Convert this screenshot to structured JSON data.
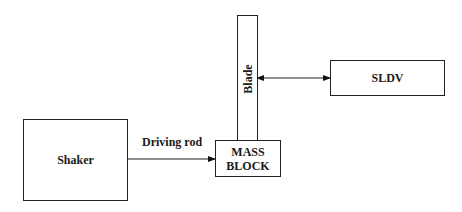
{
  "diagram": {
    "nodes": [
      {
        "id": "shaker",
        "label": "Shaker"
      },
      {
        "id": "mass_block",
        "label_line1": "MASS",
        "label_line2": "BLOCK"
      },
      {
        "id": "blade",
        "label": "Blade"
      },
      {
        "id": "sldv",
        "label": "SLDV"
      }
    ],
    "edges": [
      {
        "from": "shaker",
        "to": "mass_block",
        "label": "Driving rod",
        "direction": "forward"
      },
      {
        "from": "blade",
        "to": "sldv",
        "label": "",
        "direction": "bidirectional"
      }
    ]
  },
  "labels": {
    "shaker": "Shaker",
    "mass_line1": "MASS",
    "mass_line2": "BLOCK",
    "blade": "Blade",
    "sldv": "SLDV",
    "driving_rod": "Driving rod"
  }
}
